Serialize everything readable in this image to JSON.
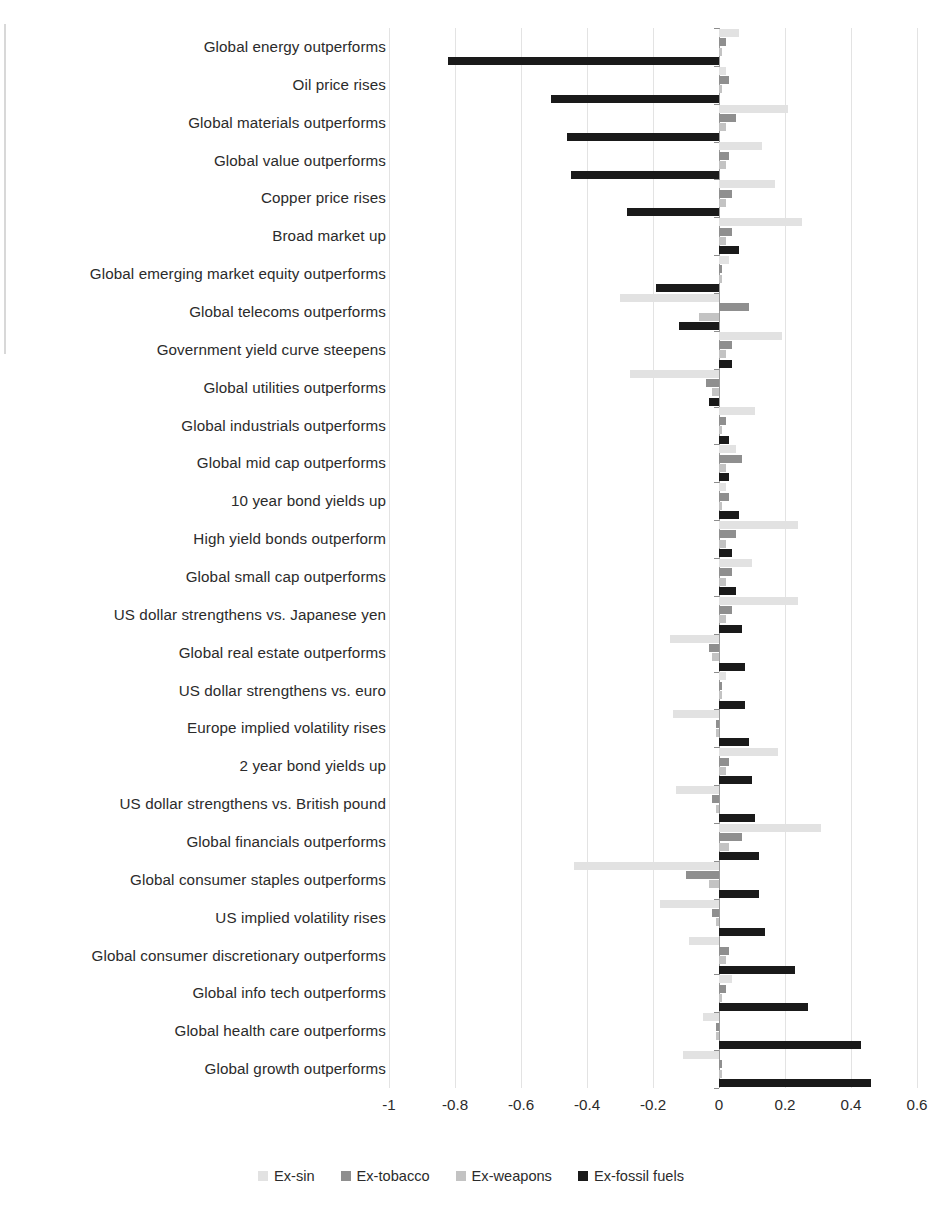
{
  "chart_data": {
    "type": "bar",
    "orientation": "horizontal",
    "title": "",
    "subtitle": "",
    "xlabel": "",
    "ylabel": "",
    "xlim": [
      -1.0,
      0.6
    ],
    "xticks": [
      "-1",
      "-0.8",
      "-0.6",
      "-0.4",
      "-0.2",
      "0",
      "0.2",
      "0.4",
      "0.6"
    ],
    "xtick_values": [
      -1.0,
      -0.8,
      -0.6,
      -0.4,
      -0.2,
      0,
      0.2,
      0.4,
      0.6
    ],
    "grid": true,
    "legend_position": "bottom",
    "categories": [
      "Global energy outperforms",
      "Oil price rises",
      "Global materials outperforms",
      "Global value outperforms",
      "Copper price rises",
      "Broad market up",
      "Global emerging market equity outperforms",
      "Global telecoms outperforms",
      "Government yield curve steepens",
      "Global utilities outperforms",
      "Global industrials outperforms",
      "Global mid cap outperforms",
      "10 year bond yields up",
      "High yield bonds outperform",
      "Global small cap outperforms",
      "US dollar strengthens vs. Japanese yen",
      "Global real estate outperforms",
      "US dollar strengthens vs. euro",
      "Europe implied volatility rises",
      "2 year bond yields up",
      "US dollar strengthens vs. British pound",
      "Global financials outperforms",
      "Global consumer staples outperforms",
      "US implied volatility rises",
      "Global consumer discretionary outperforms",
      "Global info tech outperforms",
      "Global health care outperforms",
      "Global growth outperforms"
    ],
    "series": [
      {
        "name": "Ex-sin",
        "color": "#e2e2e2",
        "values": [
          0.06,
          0.02,
          0.21,
          0.13,
          0.17,
          0.25,
          0.03,
          -0.3,
          0.19,
          -0.27,
          0.11,
          0.05,
          0.02,
          0.24,
          0.1,
          0.24,
          -0.15,
          0.02,
          -0.14,
          0.18,
          -0.13,
          0.31,
          -0.44,
          -0.18,
          -0.09,
          0.04,
          -0.05,
          -0.11
        ]
      },
      {
        "name": "Ex-tobacco",
        "color": "#8f8f8f",
        "values": [
          0.02,
          0.03,
          0.05,
          0.03,
          0.04,
          0.04,
          0.01,
          0.09,
          0.04,
          -0.04,
          0.02,
          0.07,
          0.03,
          0.05,
          0.04,
          0.04,
          -0.03,
          0.01,
          -0.01,
          0.03,
          -0.02,
          0.07,
          -0.1,
          -0.02,
          0.03,
          0.02,
          -0.01,
          0.01
        ]
      },
      {
        "name": "Ex-weapons",
        "color": "#c3c3c3",
        "values": [
          0.01,
          0.01,
          0.02,
          0.02,
          0.02,
          0.02,
          0.01,
          -0.06,
          0.02,
          -0.02,
          0.01,
          0.02,
          0.01,
          0.02,
          0.02,
          0.02,
          -0.02,
          0.01,
          -0.01,
          0.02,
          -0.01,
          0.03,
          -0.03,
          -0.01,
          0.02,
          0.01,
          -0.01,
          0.01
        ]
      },
      {
        "name": "Ex-fossil fuels",
        "color": "#1a1a1a",
        "values": [
          -0.82,
          -0.51,
          -0.46,
          -0.45,
          -0.28,
          0.06,
          -0.19,
          -0.12,
          0.04,
          -0.03,
          0.03,
          0.03,
          0.06,
          0.04,
          0.05,
          0.07,
          0.08,
          0.08,
          0.09,
          0.1,
          0.11,
          0.12,
          0.12,
          0.14,
          0.23,
          0.27,
          0.43,
          0.46
        ]
      }
    ]
  },
  "legend": {
    "items": [
      {
        "label": "Ex-sin",
        "color": "#e2e2e2"
      },
      {
        "label": "Ex-tobacco",
        "color": "#8f8f8f"
      },
      {
        "label": "Ex-weapons",
        "color": "#c3c3c3"
      },
      {
        "label": "Ex-fossil fuels",
        "color": "#1a1a1a"
      }
    ]
  }
}
